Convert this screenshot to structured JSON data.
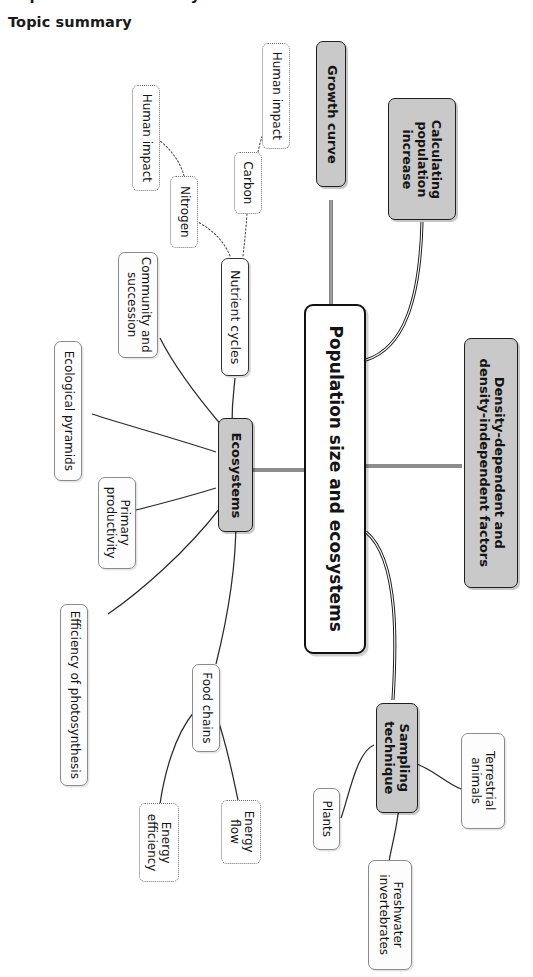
{
  "header": {
    "cut_off_title": "Populations and ecosystems",
    "section_label": "Topic summary"
  },
  "colors": {
    "accent_gray_fill": "#c9c9c9",
    "node_border": "#8e8e8e",
    "center_border": "#111111",
    "text": "#141414",
    "page_background": "#ffffff"
  },
  "diagram": {
    "type": "mind-map",
    "orientation": "rotated-90-clockwise",
    "center": {
      "label": "Population size and ecosystems",
      "style": "center"
    },
    "nodes": [
      {
        "id": "growth-curve",
        "label": "Growth curve",
        "style": "gray"
      },
      {
        "id": "calculating",
        "label": "Calculating\npopulation\nincrease",
        "style": "gray"
      },
      {
        "id": "density-factors",
        "label": "Density-dependent and\ndensity-independent factors",
        "style": "gray"
      },
      {
        "id": "sampling-technique",
        "label": "Sampling\ntechnique",
        "style": "gray"
      },
      {
        "id": "ecosystems",
        "label": "Ecosystems",
        "style": "gray"
      },
      {
        "id": "plants",
        "label": "Plants",
        "style": "solid"
      },
      {
        "id": "terrestrial-animals",
        "label": "Terrestrial\nanimals",
        "style": "solid"
      },
      {
        "id": "freshwater-inverts",
        "label": "Freshwater\ninvertebrates",
        "style": "solid"
      },
      {
        "id": "nutrient-cycles",
        "label": "Nutrient cycles",
        "style": "bold-solid"
      },
      {
        "id": "community-succession",
        "label": "Community and\nsuccession",
        "style": "solid"
      },
      {
        "id": "ecological-pyramids",
        "label": "Ecological pyramids",
        "style": "solid"
      },
      {
        "id": "primary-productivity",
        "label": "Primary\nproductivity",
        "style": "solid"
      },
      {
        "id": "efficiency-photosynthesis",
        "label": "Efficiency of photosynthesis",
        "style": "solid"
      },
      {
        "id": "food-chains",
        "label": "Food chains",
        "style": "solid"
      },
      {
        "id": "energy-efficiency",
        "label": "Energy\nefficiency",
        "style": "dotted"
      },
      {
        "id": "energy-flow",
        "label": "Energy\nflow",
        "style": "dotted"
      },
      {
        "id": "carbon",
        "label": "Carbon",
        "style": "dotted"
      },
      {
        "id": "nitrogen",
        "label": "Nitrogen",
        "style": "dotted"
      },
      {
        "id": "human-impact-carbon",
        "label": "Human impact",
        "style": "dotted"
      },
      {
        "id": "human-impact-nitrogen",
        "label": "Human impact",
        "style": "dotted"
      }
    ],
    "edges": [
      {
        "from": "center",
        "to": "growth-curve"
      },
      {
        "from": "center",
        "to": "calculating"
      },
      {
        "from": "center",
        "to": "density-factors"
      },
      {
        "from": "center",
        "to": "sampling-technique"
      },
      {
        "from": "center",
        "to": "ecosystems"
      },
      {
        "from": "sampling-technique",
        "to": "plants"
      },
      {
        "from": "sampling-technique",
        "to": "terrestrial-animals"
      },
      {
        "from": "sampling-technique",
        "to": "freshwater-inverts"
      },
      {
        "from": "ecosystems",
        "to": "nutrient-cycles"
      },
      {
        "from": "ecosystems",
        "to": "community-succession"
      },
      {
        "from": "ecosystems",
        "to": "ecological-pyramids"
      },
      {
        "from": "ecosystems",
        "to": "primary-productivity"
      },
      {
        "from": "ecosystems",
        "to": "efficiency-photosynthesis"
      },
      {
        "from": "ecosystems",
        "to": "food-chains"
      },
      {
        "from": "food-chains",
        "to": "energy-efficiency"
      },
      {
        "from": "food-chains",
        "to": "energy-flow"
      },
      {
        "from": "nutrient-cycles",
        "to": "carbon"
      },
      {
        "from": "nutrient-cycles",
        "to": "nitrogen"
      },
      {
        "from": "carbon",
        "to": "human-impact-carbon"
      },
      {
        "from": "nitrogen",
        "to": "human-impact-nitrogen"
      }
    ]
  }
}
